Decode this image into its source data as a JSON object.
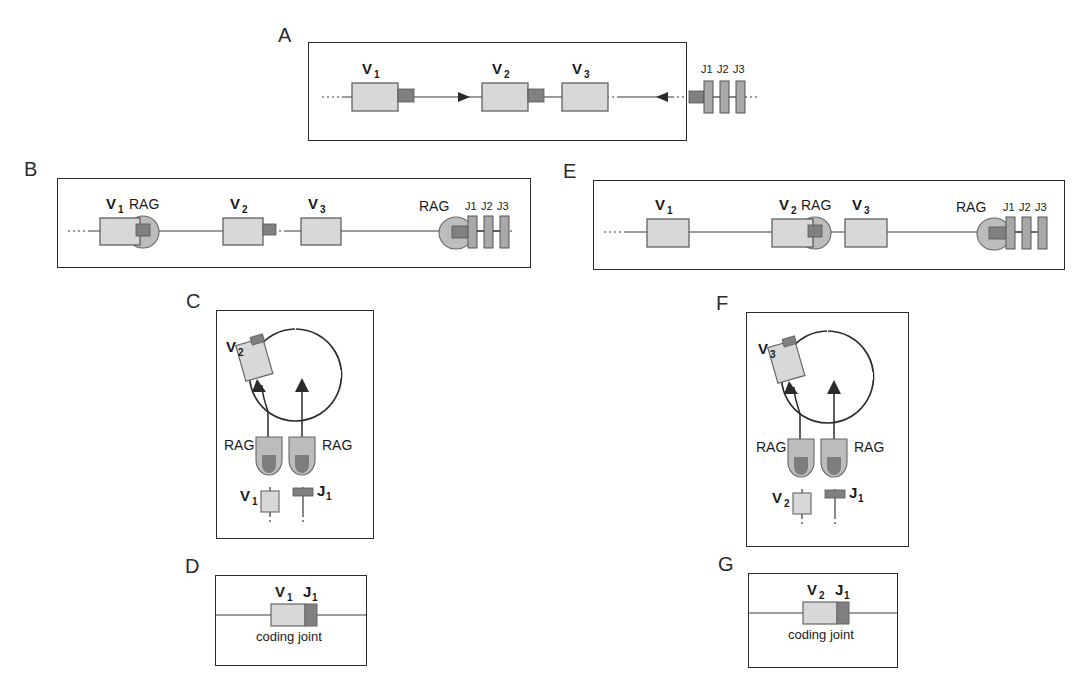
{
  "figure": {
    "colors": {
      "v_segment_fill": "#d8d8d8",
      "rss_fill": "#808080",
      "rag_fill": "#bcbcbc",
      "rag_dark_fill": "#7d7d7d",
      "j_segment_fill": "#a8a8a8",
      "line": "#3a3a3a",
      "border": "#2b2b2b",
      "text": "#1a1a1a",
      "background": "#ffffff"
    }
  },
  "panels": [
    {
      "id": "A",
      "label": "A",
      "kind": "linear-locus",
      "v_segments": [
        {
          "label": "V",
          "sub": "1"
        },
        {
          "label": "V",
          "sub": "2"
        },
        {
          "label": "V",
          "sub": "3"
        }
      ],
      "j_segments": [
        "J1",
        "J2",
        "J3"
      ],
      "arrows": [
        "right",
        "left"
      ],
      "rag_labels": []
    },
    {
      "id": "B",
      "label": "B",
      "kind": "linear-locus-rag",
      "v_segments": [
        {
          "label": "V",
          "sub": "1"
        },
        {
          "label": "V",
          "sub": "2"
        },
        {
          "label": "V",
          "sub": "3"
        }
      ],
      "j_segments": [
        "J1",
        "J2",
        "J3"
      ],
      "rag_labels": [
        "RAG",
        "RAG"
      ],
      "rag_bound_to": "V1"
    },
    {
      "id": "E",
      "label": "E",
      "kind": "linear-locus-rag",
      "v_segments": [
        {
          "label": "V",
          "sub": "1"
        },
        {
          "label": "V",
          "sub": "2"
        },
        {
          "label": "V",
          "sub": "3"
        }
      ],
      "j_segments": [
        "J1",
        "J2",
        "J3"
      ],
      "rag_labels": [
        "RAG",
        "RAG"
      ],
      "rag_bound_to": "V2"
    },
    {
      "id": "C",
      "label": "C",
      "kind": "synapsis-loop",
      "loop_segment": {
        "label": "V",
        "sub": "2"
      },
      "rag_labels": [
        "RAG",
        "RAG"
      ],
      "bottom_v": {
        "label": "V",
        "sub": "1"
      },
      "bottom_j": {
        "label": "J",
        "sub": "1"
      }
    },
    {
      "id": "F",
      "label": "F",
      "kind": "synapsis-loop",
      "loop_segment": {
        "label": "V",
        "sub": "3"
      },
      "rag_labels": [
        "RAG",
        "RAG"
      ],
      "bottom_v": {
        "label": "V",
        "sub": "2"
      },
      "bottom_j": {
        "label": "J",
        "sub": "1"
      }
    },
    {
      "id": "D",
      "label": "D",
      "kind": "coding-joint",
      "v_segment": {
        "label": "V",
        "sub": "1"
      },
      "j_segment": {
        "label": "J",
        "sub": "1"
      },
      "caption": "coding joint"
    },
    {
      "id": "G",
      "label": "G",
      "kind": "coding-joint",
      "v_segment": {
        "label": "V",
        "sub": "2"
      },
      "j_segment": {
        "label": "J",
        "sub": "1"
      },
      "caption": "coding joint"
    }
  ]
}
